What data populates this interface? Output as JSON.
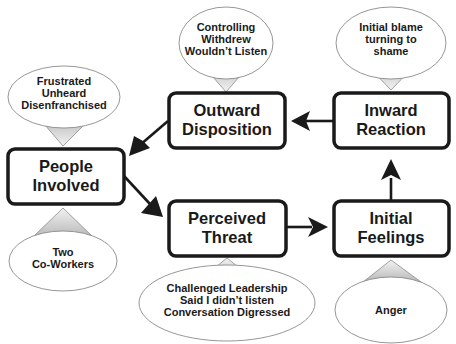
{
  "diagram": {
    "type": "cycle-flow",
    "nodes": [
      {
        "id": "people",
        "lines": [
          "People",
          "Involved"
        ]
      },
      {
        "id": "threat",
        "lines": [
          "Perceived",
          "Threat"
        ]
      },
      {
        "id": "feelings",
        "lines": [
          "Initial",
          "Feelings"
        ]
      },
      {
        "id": "inward",
        "lines": [
          "Inward",
          "Reaction"
        ]
      },
      {
        "id": "outward",
        "lines": [
          "Outward",
          "Disposition"
        ]
      }
    ],
    "callouts": [
      {
        "for": "people",
        "position": "below",
        "lines": [
          "Two",
          "Co-Workers"
        ]
      },
      {
        "for": "people",
        "position": "above",
        "lines": [
          "Frustrated",
          "Unheard",
          "Disenfranchised"
        ]
      },
      {
        "for": "threat",
        "position": "below",
        "lines": [
          "Challenged Leadership",
          "Said I didn’t listen",
          "Conversation Digressed"
        ]
      },
      {
        "for": "feelings",
        "position": "below",
        "lines": [
          "Anger"
        ]
      },
      {
        "for": "inward",
        "position": "above",
        "lines": [
          "Initial blame",
          "turning to",
          "shame"
        ]
      },
      {
        "for": "outward",
        "position": "above",
        "lines": [
          "Controlling",
          "Withdrew",
          "Wouldn’t Listen"
        ]
      }
    ],
    "edges": [
      {
        "from": "people",
        "to": "threat"
      },
      {
        "from": "threat",
        "to": "feelings"
      },
      {
        "from": "feelings",
        "to": "inward"
      },
      {
        "from": "inward",
        "to": "outward"
      },
      {
        "from": "outward",
        "to": "people"
      }
    ],
    "colors": {
      "stroke": "#1a1a1a",
      "bubble_stroke": "#8a8a8a",
      "pointer_fill": "#c8c8c8"
    }
  }
}
